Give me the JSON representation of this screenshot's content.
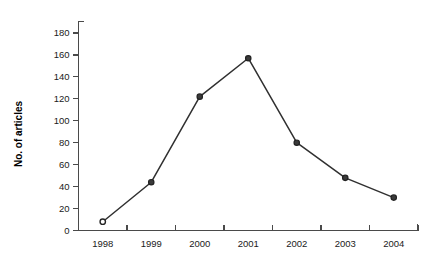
{
  "chart_data": {
    "type": "line",
    "title": "",
    "subtitle": "",
    "xlabel": "",
    "ylabel": "No. of articles",
    "categories": [
      "1998",
      "1999",
      "2000",
      "2001",
      "2002",
      "2003",
      "2004"
    ],
    "x": [
      1998,
      1999,
      2000,
      2001,
      2002,
      2003,
      2004
    ],
    "values": [
      8,
      44,
      122,
      157,
      80,
      48,
      30
    ],
    "series": [
      {
        "name": "No. of articles",
        "values": [
          8,
          44,
          122,
          157,
          80,
          48,
          30
        ]
      }
    ],
    "ylim": [
      0,
      180
    ],
    "ytick_step": 20,
    "yticks": [
      0,
      20,
      40,
      60,
      80,
      100,
      120,
      140,
      160,
      180
    ],
    "ytick_labels": [
      "0",
      "20",
      "40",
      "60",
      "80",
      "100",
      "120",
      "140",
      "160",
      "180"
    ],
    "xticks": [
      1998,
      1999,
      2000,
      2001,
      2002,
      2003,
      2004
    ],
    "xtick_labels": [
      "1998",
      "1999",
      "2000",
      "2001",
      "2002",
      "2003",
      "2004"
    ],
    "grid": false,
    "legend": false,
    "legend_position": "none",
    "line_color": "#303030",
    "marker_color": "#3a3a3a",
    "marker_shape": "circle",
    "background_color": "#ffffff",
    "axis_color": "#4a4a4a",
    "annotations": []
  }
}
